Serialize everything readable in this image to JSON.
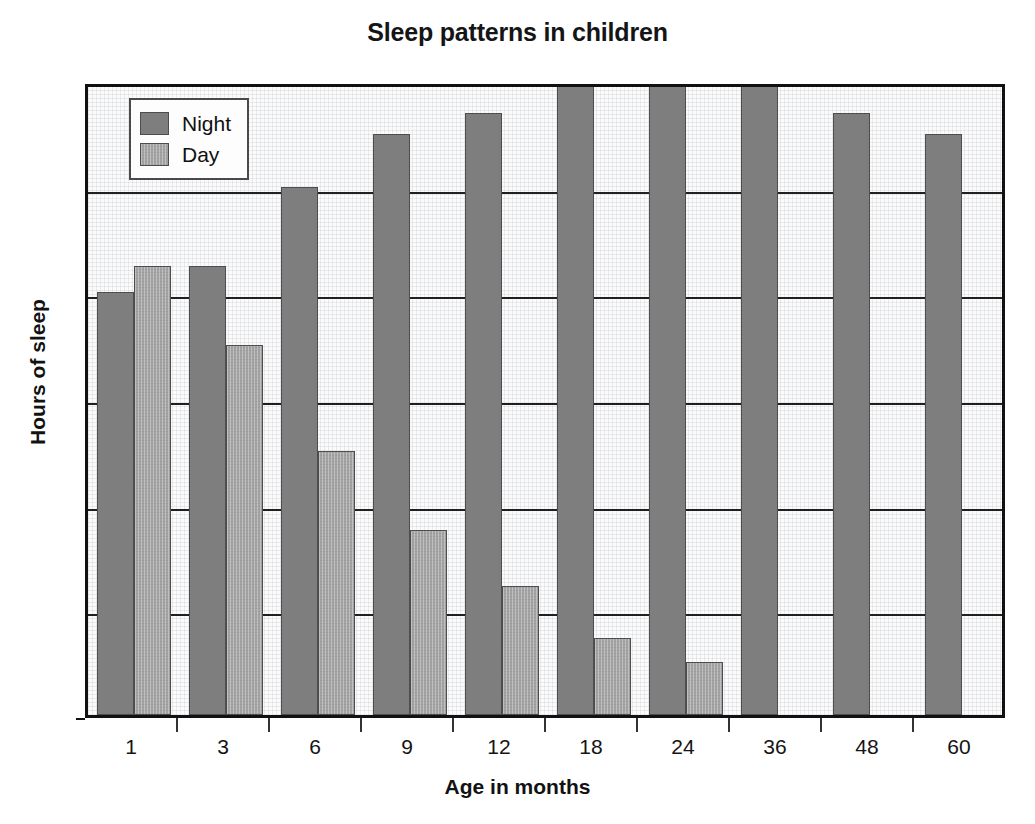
{
  "chart_data": {
    "type": "bar",
    "title": "Sleep patterns in children",
    "xlabel": "Age in months",
    "ylabel": "Hours of sleep",
    "categories": [
      "1",
      "3",
      "6",
      "9",
      "12",
      "18",
      "24",
      "36",
      "48",
      "60"
    ],
    "series": [
      {
        "name": "Night",
        "color": "#7e7e7e",
        "values": [
          8.0,
          8.5,
          10.0,
          11.0,
          11.4,
          12.0,
          12.0,
          12.0,
          11.4,
          11.0
        ]
      },
      {
        "name": "Day",
        "color": "#a3a3a3",
        "values": [
          8.5,
          7.0,
          5.0,
          3.5,
          2.45,
          1.45,
          1.0,
          null,
          null,
          null
        ]
      }
    ],
    "ylim": [
      0,
      12
    ],
    "yticks": [
      0,
      2,
      4,
      6,
      8,
      10,
      12
    ],
    "ytick_labels": [
      "0",
      "2",
      "4",
      "6",
      "8",
      "10",
      "12"
    ],
    "grid": "horizontal",
    "legend_position": "top-left",
    "legend_entries": [
      "Night",
      "Day"
    ]
  }
}
